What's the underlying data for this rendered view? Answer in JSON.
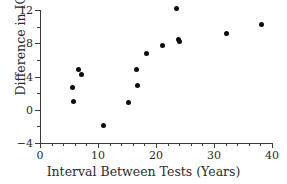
{
  "chart_data": {
    "type": "scatter",
    "title": "",
    "xlabel": "Interval Between Tests (Years)",
    "ylabel": "Difference in IQ Scores",
    "xlim": [
      0,
      40
    ],
    "ylim": [
      -4,
      12
    ],
    "grid": false,
    "legend": null,
    "x_major_ticks": [
      0,
      10,
      20,
      30,
      40
    ],
    "x_major_tick_labels": [
      "0",
      "10",
      "20",
      "30",
      "40"
    ],
    "x_minor_ticks": [
      2,
      4,
      6,
      8,
      12,
      14,
      16,
      18,
      22,
      24,
      26,
      28,
      32,
      34,
      36,
      38
    ],
    "y_major_ticks": [
      -4,
      0,
      4,
      8,
      12
    ],
    "y_major_tick_labels": [
      "−4",
      "0",
      "4",
      "8",
      "12"
    ],
    "y_minor_ticks": [
      -2,
      2,
      6,
      10
    ],
    "marker": "filled-circle",
    "marker_color": "#0d0d0d",
    "points": [
      {
        "x": 5.6,
        "y": 2.7
      },
      {
        "x": 5.8,
        "y": 1.0
      },
      {
        "x": 6.6,
        "y": 4.8
      },
      {
        "x": 7.1,
        "y": 4.3
      },
      {
        "x": 11.0,
        "y": -1.9
      },
      {
        "x": 15.3,
        "y": 0.9
      },
      {
        "x": 16.6,
        "y": 4.8
      },
      {
        "x": 16.8,
        "y": 2.9
      },
      {
        "x": 18.3,
        "y": 6.8
      },
      {
        "x": 21.1,
        "y": 7.7
      },
      {
        "x": 23.6,
        "y": 12.2
      },
      {
        "x": 23.8,
        "y": 8.5
      },
      {
        "x": 24.0,
        "y": 8.2
      },
      {
        "x": 32.1,
        "y": 9.2
      },
      {
        "x": 38.2,
        "y": 10.2
      }
    ]
  }
}
